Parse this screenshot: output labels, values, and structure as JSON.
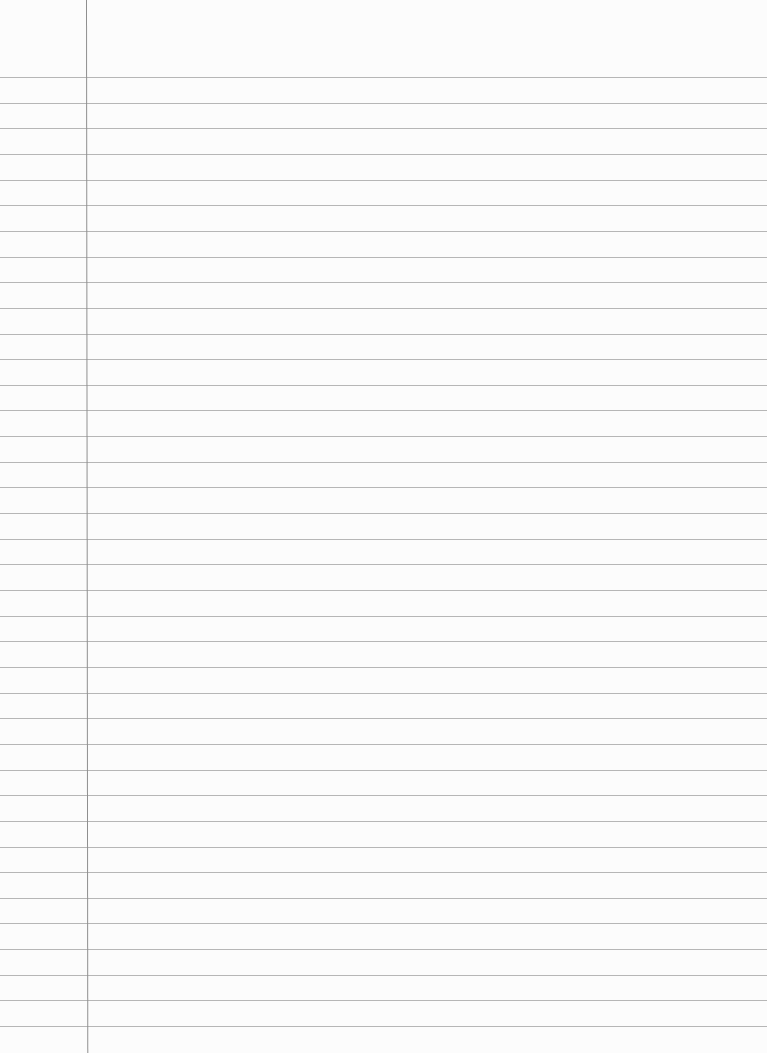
{
  "page": {
    "type": "ruled-notebook-paper",
    "content_text": "",
    "colors": {
      "paper": "#fcfcfc",
      "rule_line": "#a9a9a9",
      "margin_line": "#8f8f8f"
    },
    "rules": {
      "first_line_y": 77,
      "spacing_px": 25.65,
      "count": 38
    },
    "margin": {
      "x": 86
    }
  }
}
